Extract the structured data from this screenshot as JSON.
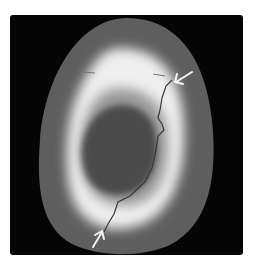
{
  "image": {
    "description": "Grayscale cross-sectional scan of an egg-shaped bone with a bright cortical ring, dark central cavity, and a fracture line indicated by two white arrows",
    "colors": {
      "background": "#050505",
      "outer_tissue": "#5a5a5a",
      "cortex": "#e8e8e8",
      "cavity": "#4a4a4a",
      "arrows": "#f2f2f2",
      "fracture_line": "#3a3a3a"
    },
    "annotations": [
      {
        "type": "arrow",
        "label": "upper-right-arrow",
        "points_to": "fracture upper end"
      },
      {
        "type": "arrow",
        "label": "lower-left-arrow",
        "points_to": "fracture lower end"
      }
    ]
  }
}
